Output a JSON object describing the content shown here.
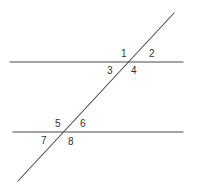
{
  "diagram": {
    "title": "",
    "line_color": "#4a4a4a",
    "label_color": "#333333",
    "lines": {
      "upper_parallel": {
        "x1": 10,
        "y1": 62,
        "x2": 183,
        "y2": 62
      },
      "lower_parallel": {
        "x1": 13,
        "y1": 132,
        "x2": 183,
        "y2": 132
      },
      "transversal": {
        "x1": 174,
        "y1": 13,
        "x2": 18,
        "y2": 181
      }
    },
    "angles": [
      {
        "label": "1",
        "x": 121,
        "y": 57
      },
      {
        "label": "2",
        "x": 149,
        "y": 57
      },
      {
        "label": "3",
        "x": 107,
        "y": 74
      },
      {
        "label": "4",
        "x": 131,
        "y": 74
      },
      {
        "label": "5",
        "x": 55,
        "y": 127
      },
      {
        "label": "6",
        "x": 80,
        "y": 127
      },
      {
        "label": "7",
        "x": 41,
        "y": 144
      },
      {
        "label": "8",
        "x": 68,
        "y": 145
      }
    ]
  }
}
